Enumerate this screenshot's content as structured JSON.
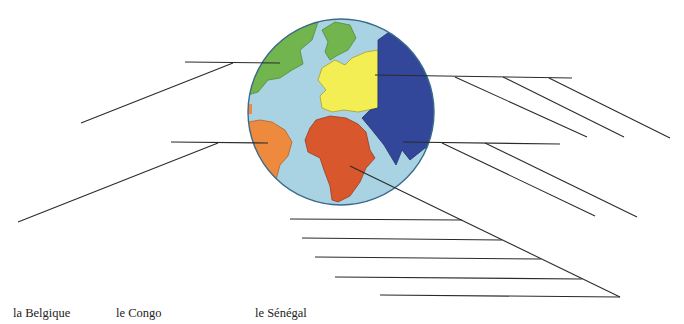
{
  "worksheet": {
    "word_bank": [
      {
        "label": "la Belgique",
        "x": 13
      },
      {
        "label": "le Congo",
        "x": 116
      },
      {
        "label": "le Sénégal",
        "x": 255
      }
    ]
  },
  "globe": {
    "cx": 341,
    "cy": 112,
    "r": 93,
    "colors": {
      "ocean": "#a9d3e3",
      "outline": "#3a6a8a",
      "north_america": "#72b54f",
      "europe": "#f2ee54",
      "asia": "#33479a",
      "south_america": "#ee8a3e",
      "africa": "#d9572d"
    },
    "regions": [
      "north-america",
      "europe",
      "asia",
      "south-america",
      "africa"
    ]
  },
  "answer_lines": {
    "color": "#2b2b2b",
    "left": [
      {
        "name": "north-america",
        "h": [
          185,
          62,
          280,
          63
        ],
        "d": [
          233,
          63,
          81,
          123
        ]
      },
      {
        "name": "south-america",
        "h": [
          171,
          142,
          268,
          143
        ],
        "d": [
          218,
          143,
          18,
          222
        ]
      }
    ],
    "europe_right": {
      "h": [
        375,
        75,
        572,
        78
      ],
      "diagonals": [
        [
          455,
          77,
          587,
          137
        ],
        [
          503,
          77,
          624,
          137
        ],
        [
          549,
          78,
          670,
          138
        ]
      ]
    },
    "asia_right": {
      "h": [
        403,
        142,
        560,
        144
      ],
      "diagonals": [
        [
          442,
          143,
          595,
          216
        ],
        [
          485,
          143,
          637,
          217
        ]
      ]
    },
    "africa_bottom": {
      "d": [
        350,
        166,
        620,
        297
      ],
      "h": [
        [
          290,
          219,
          462,
          220
        ],
        [
          302,
          238,
          502,
          240
        ],
        [
          315,
          257,
          541,
          259
        ],
        [
          335,
          277,
          582,
          279
        ],
        [
          380,
          295,
          620,
          297
        ]
      ]
    }
  }
}
